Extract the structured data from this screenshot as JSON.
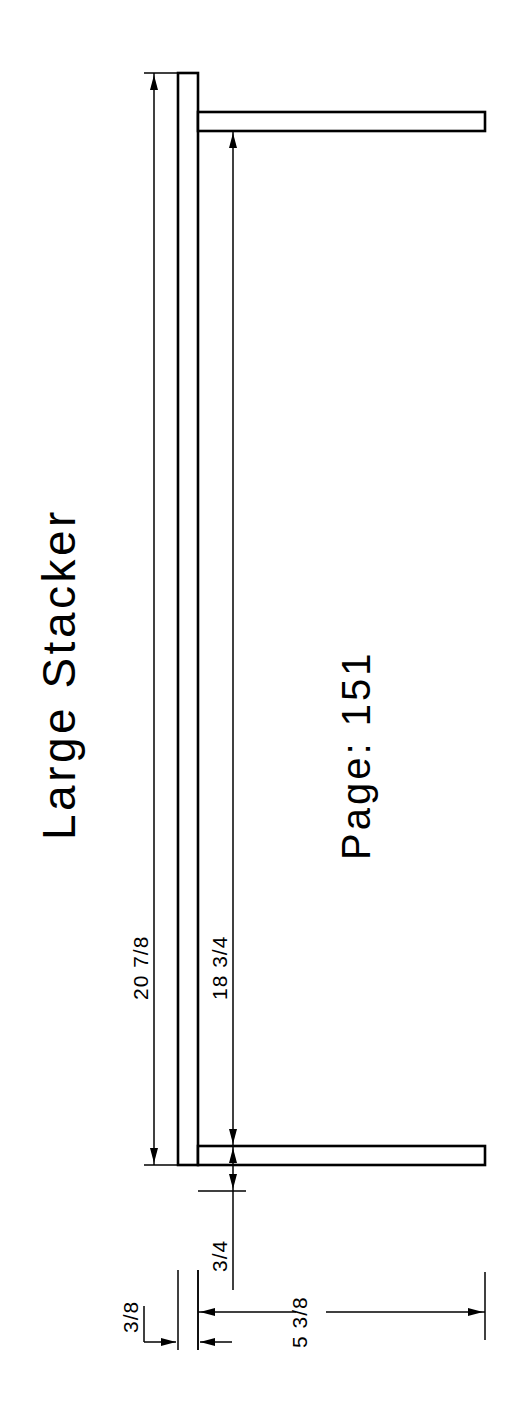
{
  "drawing": {
    "title": "Large Stacker",
    "page_label": "Page: 151",
    "background_color": "#ffffff",
    "line_color": "#000000",
    "orientation": "rotated-90-ccw",
    "dimensions": [
      {
        "id": "overall-height",
        "text": "20 7/8",
        "units": "inches"
      },
      {
        "id": "shelf-span",
        "text": "18 3/4",
        "units": "inches"
      },
      {
        "id": "shelf-thickness",
        "text": "3/4",
        "units": "inches"
      },
      {
        "id": "post-thickness",
        "text": "3/8",
        "units": "inches"
      },
      {
        "id": "shelf-depth",
        "text": "5 3/8",
        "units": "inches"
      }
    ]
  }
}
